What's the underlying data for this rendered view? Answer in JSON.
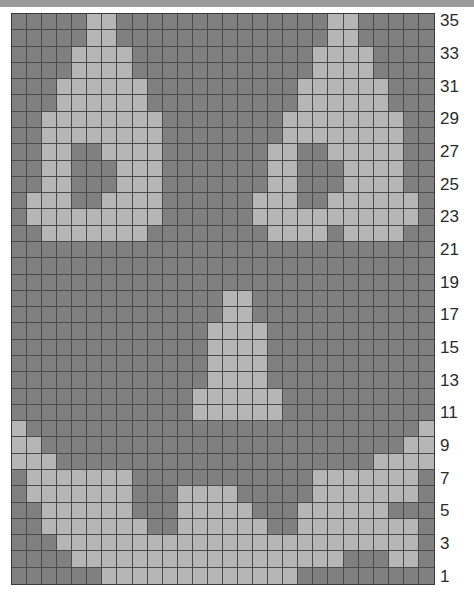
{
  "chart_data": {
    "type": "heatmap",
    "xlabel": "",
    "ylabel": "",
    "columns": 28,
    "rows": 35,
    "grid_origin": "bottom-left",
    "row_label_side": "right",
    "row_labels": [
      "35",
      "33",
      "31",
      "29",
      "27",
      "25",
      "23",
      "21",
      "19",
      "17",
      "15",
      "13",
      "11",
      "9",
      "7",
      "5",
      "3",
      "1"
    ],
    "row_label_numbers": [
      35,
      33,
      31,
      29,
      27,
      25,
      23,
      21,
      19,
      17,
      15,
      13,
      11,
      9,
      7,
      5,
      3,
      1
    ],
    "row_label_step": 2,
    "legend": [
      {
        "key": 0,
        "name": "main-colour",
        "color": "#808080",
        "label": "dark grey (MC)"
      },
      {
        "key": 1,
        "name": "contrast-colour",
        "color": "#b6b6b6",
        "label": "light grey (CC)"
      }
    ],
    "colors": {
      "dark": "#808080",
      "light": "#b6b6b6",
      "gridline": "#4a4a4a",
      "border": "#3a3a3a",
      "background": "#ffffff",
      "label_text": "#2b2b2b",
      "top_band": "#9a9a9a"
    },
    "grid_note": "Rows listed from row 35 (top) down to row 1 (bottom); 1 = light grey, 0 = dark grey; 28 stitches per row.",
    "matrix_top_to_bottom": [
      [
        0,
        0,
        0,
        0,
        0,
        1,
        1,
        0,
        0,
        0,
        0,
        0,
        0,
        0,
        0,
        0,
        0,
        0,
        0,
        0,
        0,
        1,
        1,
        0,
        0,
        0,
        0,
        0
      ],
      [
        0,
        0,
        0,
        0,
        0,
        1,
        1,
        0,
        0,
        0,
        0,
        0,
        0,
        0,
        0,
        0,
        0,
        0,
        0,
        0,
        0,
        1,
        1,
        0,
        0,
        0,
        0,
        0
      ],
      [
        0,
        0,
        0,
        0,
        1,
        1,
        1,
        1,
        0,
        0,
        0,
        0,
        0,
        0,
        0,
        0,
        0,
        0,
        0,
        0,
        1,
        1,
        1,
        1,
        0,
        0,
        0,
        0
      ],
      [
        0,
        0,
        0,
        0,
        1,
        1,
        1,
        1,
        0,
        0,
        0,
        0,
        0,
        0,
        0,
        0,
        0,
        0,
        0,
        0,
        1,
        1,
        1,
        1,
        0,
        0,
        0,
        0
      ],
      [
        0,
        0,
        0,
        1,
        1,
        1,
        1,
        1,
        1,
        0,
        0,
        0,
        0,
        0,
        0,
        0,
        0,
        0,
        0,
        1,
        1,
        1,
        1,
        1,
        1,
        0,
        0,
        0
      ],
      [
        0,
        0,
        0,
        1,
        1,
        1,
        1,
        1,
        1,
        0,
        0,
        0,
        0,
        0,
        0,
        0,
        0,
        0,
        0,
        1,
        1,
        1,
        1,
        1,
        1,
        0,
        0,
        0
      ],
      [
        0,
        0,
        1,
        1,
        1,
        1,
        1,
        1,
        1,
        1,
        0,
        0,
        0,
        0,
        0,
        0,
        0,
        0,
        1,
        1,
        1,
        1,
        1,
        1,
        1,
        1,
        0,
        0
      ],
      [
        0,
        0,
        1,
        1,
        1,
        1,
        1,
        1,
        1,
        1,
        0,
        0,
        0,
        0,
        0,
        0,
        0,
        0,
        1,
        1,
        1,
        1,
        1,
        1,
        1,
        1,
        0,
        0
      ],
      [
        0,
        0,
        1,
        1,
        0,
        0,
        1,
        1,
        1,
        1,
        0,
        0,
        0,
        0,
        0,
        0,
        0,
        1,
        1,
        0,
        0,
        1,
        1,
        1,
        1,
        1,
        0,
        0
      ],
      [
        0,
        0,
        1,
        1,
        0,
        0,
        0,
        1,
        1,
        1,
        0,
        0,
        0,
        0,
        0,
        0,
        0,
        1,
        1,
        0,
        0,
        0,
        1,
        1,
        1,
        1,
        0,
        0
      ],
      [
        0,
        0,
        1,
        1,
        0,
        0,
        0,
        1,
        1,
        1,
        0,
        0,
        0,
        0,
        0,
        0,
        0,
        1,
        1,
        0,
        0,
        0,
        1,
        1,
        1,
        1,
        0,
        0
      ],
      [
        0,
        1,
        1,
        1,
        0,
        0,
        1,
        1,
        1,
        1,
        0,
        0,
        0,
        0,
        0,
        0,
        1,
        1,
        1,
        0,
        0,
        1,
        1,
        1,
        1,
        1,
        1,
        0
      ],
      [
        0,
        1,
        1,
        1,
        1,
        1,
        1,
        1,
        1,
        1,
        0,
        0,
        0,
        0,
        0,
        0,
        1,
        1,
        1,
        1,
        1,
        1,
        1,
        1,
        1,
        1,
        1,
        0
      ],
      [
        0,
        0,
        1,
        1,
        1,
        1,
        1,
        1,
        1,
        0,
        0,
        0,
        0,
        0,
        0,
        0,
        0,
        1,
        1,
        1,
        1,
        0,
        1,
        1,
        1,
        1,
        0,
        0
      ],
      [
        0,
        0,
        0,
        0,
        0,
        0,
        0,
        0,
        0,
        0,
        0,
        0,
        0,
        0,
        0,
        0,
        0,
        0,
        0,
        0,
        0,
        0,
        0,
        0,
        0,
        0,
        0,
        0
      ],
      [
        0,
        0,
        0,
        0,
        0,
        0,
        0,
        0,
        0,
        0,
        0,
        0,
        0,
        0,
        0,
        0,
        0,
        0,
        0,
        0,
        0,
        0,
        0,
        0,
        0,
        0,
        0,
        0
      ],
      [
        0,
        0,
        0,
        0,
        0,
        0,
        0,
        0,
        0,
        0,
        0,
        0,
        0,
        0,
        0,
        0,
        0,
        0,
        0,
        0,
        0,
        0,
        0,
        0,
        0,
        0,
        0,
        0
      ],
      [
        0,
        0,
        0,
        0,
        0,
        0,
        0,
        0,
        0,
        0,
        0,
        0,
        0,
        0,
        1,
        1,
        0,
        0,
        0,
        0,
        0,
        0,
        0,
        0,
        0,
        0,
        0,
        0
      ],
      [
        0,
        0,
        0,
        0,
        0,
        0,
        0,
        0,
        0,
        0,
        0,
        0,
        0,
        0,
        1,
        1,
        0,
        0,
        0,
        0,
        0,
        0,
        0,
        0,
        0,
        0,
        0,
        0
      ],
      [
        0,
        0,
        0,
        0,
        0,
        0,
        0,
        0,
        0,
        0,
        0,
        0,
        0,
        1,
        1,
        1,
        1,
        0,
        0,
        0,
        0,
        0,
        0,
        0,
        0,
        0,
        0,
        0
      ],
      [
        0,
        0,
        0,
        0,
        0,
        0,
        0,
        0,
        0,
        0,
        0,
        0,
        0,
        1,
        1,
        1,
        1,
        0,
        0,
        0,
        0,
        0,
        0,
        0,
        0,
        0,
        0,
        0
      ],
      [
        0,
        0,
        0,
        0,
        0,
        0,
        0,
        0,
        0,
        0,
        0,
        0,
        0,
        1,
        1,
        1,
        1,
        0,
        0,
        0,
        0,
        0,
        0,
        0,
        0,
        0,
        0,
        0
      ],
      [
        0,
        0,
        0,
        0,
        0,
        0,
        0,
        0,
        0,
        0,
        0,
        0,
        0,
        1,
        1,
        1,
        1,
        0,
        0,
        0,
        0,
        0,
        0,
        0,
        0,
        0,
        0,
        0
      ],
      [
        0,
        0,
        0,
        0,
        0,
        0,
        0,
        0,
        0,
        0,
        0,
        0,
        1,
        1,
        1,
        1,
        1,
        1,
        0,
        0,
        0,
        0,
        0,
        0,
        0,
        0,
        0,
        0
      ],
      [
        0,
        0,
        0,
        0,
        0,
        0,
        0,
        0,
        0,
        0,
        0,
        0,
        1,
        1,
        1,
        1,
        1,
        1,
        0,
        0,
        0,
        0,
        0,
        0,
        0,
        0,
        0,
        0
      ],
      [
        1,
        0,
        0,
        0,
        0,
        0,
        0,
        0,
        0,
        0,
        0,
        0,
        0,
        0,
        0,
        0,
        0,
        0,
        0,
        0,
        0,
        0,
        0,
        0,
        0,
        0,
        0,
        1
      ],
      [
        1,
        1,
        0,
        0,
        0,
        0,
        0,
        0,
        0,
        0,
        0,
        0,
        0,
        0,
        0,
        0,
        0,
        0,
        0,
        0,
        0,
        0,
        0,
        0,
        0,
        0,
        1,
        1
      ],
      [
        1,
        1,
        1,
        0,
        0,
        0,
        0,
        0,
        0,
        0,
        0,
        0,
        0,
        0,
        0,
        0,
        0,
        0,
        0,
        0,
        0,
        0,
        0,
        0,
        1,
        1,
        1,
        1
      ],
      [
        0,
        1,
        1,
        1,
        1,
        1,
        1,
        1,
        0,
        0,
        0,
        0,
        0,
        0,
        0,
        0,
        0,
        0,
        0,
        0,
        1,
        1,
        1,
        1,
        1,
        1,
        1,
        0
      ],
      [
        0,
        1,
        1,
        1,
        1,
        1,
        1,
        1,
        0,
        0,
        0,
        1,
        1,
        1,
        1,
        0,
        0,
        0,
        0,
        0,
        1,
        1,
        1,
        1,
        1,
        1,
        1,
        0
      ],
      [
        0,
        0,
        1,
        1,
        1,
        1,
        1,
        1,
        0,
        0,
        0,
        1,
        1,
        1,
        1,
        1,
        0,
        0,
        0,
        1,
        1,
        1,
        1,
        1,
        1,
        0,
        0,
        0
      ],
      [
        0,
        0,
        1,
        1,
        1,
        1,
        1,
        1,
        1,
        0,
        0,
        1,
        1,
        1,
        1,
        1,
        1,
        0,
        0,
        1,
        1,
        1,
        1,
        1,
        1,
        1,
        1,
        0
      ],
      [
        0,
        0,
        0,
        1,
        1,
        1,
        1,
        1,
        1,
        1,
        1,
        1,
        1,
        1,
        1,
        1,
        1,
        1,
        1,
        1,
        1,
        1,
        1,
        1,
        1,
        1,
        1,
        0
      ],
      [
        0,
        0,
        0,
        0,
        1,
        1,
        1,
        1,
        1,
        1,
        1,
        1,
        1,
        1,
        1,
        1,
        1,
        1,
        1,
        1,
        1,
        1,
        0,
        0,
        0,
        1,
        1,
        0
      ],
      [
        0,
        0,
        0,
        0,
        0,
        0,
        1,
        1,
        1,
        1,
        1,
        1,
        1,
        1,
        1,
        1,
        1,
        1,
        1,
        0,
        0,
        0,
        0,
        0,
        0,
        0,
        0,
        0
      ]
    ]
  }
}
